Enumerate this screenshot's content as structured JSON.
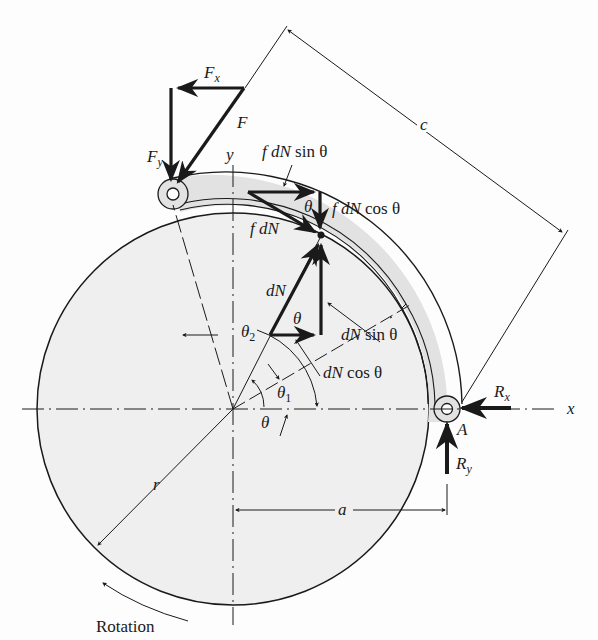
{
  "figure": {
    "type": "brake-shoe-force-diagram",
    "colors": {
      "drum_fill": "#efefef",
      "shoe_fill": "#e2e2e2",
      "ink": "#1a1a1a",
      "background": "#fdfdfd"
    }
  },
  "labels": {
    "Fx": {
      "main": "F",
      "sub": "x"
    },
    "Fy": {
      "main": "F",
      "sub": "y"
    },
    "F": "F",
    "y_axis": "y",
    "x_axis": "x",
    "c": "c",
    "f_dN_sin": {
      "pre": "f dN",
      "post": " sin θ"
    },
    "f_dN_cos": {
      "pre": "f dN",
      "post": " cos θ"
    },
    "f_dN": "f dN",
    "theta_top": "θ",
    "dN": "dN",
    "theta_mid": "θ",
    "dN_sin": {
      "pre": "dN",
      "post": " sin θ"
    },
    "dN_cos": {
      "pre": "dN",
      "post": " cos θ"
    },
    "theta2": {
      "main": "θ",
      "sub": "2"
    },
    "theta1": {
      "main": "θ",
      "sub": "1"
    },
    "theta": "θ",
    "Rx": {
      "main": "R",
      "sub": "x"
    },
    "Ry": {
      "main": "R",
      "sub": "y"
    },
    "A": "A",
    "r": "r",
    "a": "a",
    "rotation": "Rotation"
  }
}
